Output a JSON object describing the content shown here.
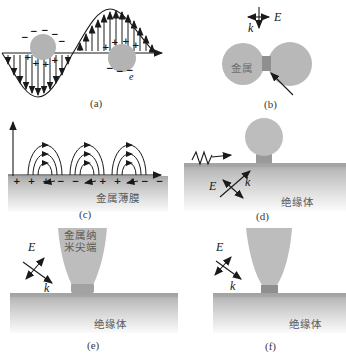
{
  "panel_labels": {
    "a": "(a)",
    "b": "(b)",
    "c": "(c)",
    "d": "(d)",
    "e": "(e)",
    "f": "(f)"
  },
  "labels": {
    "electric_field": "E",
    "wave_vector": "k",
    "electron": "e",
    "metal": "金属",
    "metal_film": "金属薄膜",
    "metal_nanotip_line1": "金属纳",
    "metal_nanotip_line2": "米尖端",
    "insulator": "绝缘体"
  },
  "charges": {
    "a_left_minus": [
      "−",
      "−",
      "−",
      "−",
      "−"
    ],
    "a_left_plus": [
      "+",
      "+",
      "+",
      "+"
    ],
    "a_right_plus": [
      "+",
      "+",
      "+",
      "+"
    ],
    "a_right_minus": [
      "−",
      "−",
      "−"
    ],
    "c_groups": [
      "+ + +",
      "− − −",
      "+ + +",
      "− −"
    ]
  },
  "colors": {
    "particle_gray": "#b8b8b8",
    "sphere_gray": "#bdbdbd",
    "junction_gray": "#8f8f8f",
    "neck_gray": "#9a9a9a",
    "substrate_top": "#a6a6a6",
    "line_color": "#1a1a1a"
  }
}
